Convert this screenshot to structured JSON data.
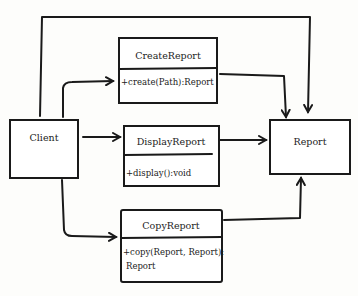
{
  "diagram": {
    "type": "UML class diagram (hand-drawn)",
    "classes": [
      {
        "id": "client",
        "name": "Client",
        "methods": []
      },
      {
        "id": "create",
        "name": "CreateReport",
        "methods": [
          "+create(Path):Report"
        ]
      },
      {
        "id": "display",
        "name": "DisplayReport",
        "methods": [
          "+display():void"
        ]
      },
      {
        "id": "copy",
        "name": "CopyReport",
        "methods": [
          "+copy(Report, Report):",
          "Report"
        ]
      },
      {
        "id": "report",
        "name": "Report",
        "methods": []
      }
    ],
    "relations": [
      {
        "from": "Client",
        "to": "CreateReport"
      },
      {
        "from": "Client",
        "to": "DisplayReport"
      },
      {
        "from": "Client",
        "to": "CopyReport"
      },
      {
        "from": "Client",
        "to": "Report"
      },
      {
        "from": "CreateReport",
        "to": "Report"
      },
      {
        "from": "DisplayReport",
        "to": "Report"
      },
      {
        "from": "CopyReport",
        "to": "Report"
      }
    ]
  }
}
